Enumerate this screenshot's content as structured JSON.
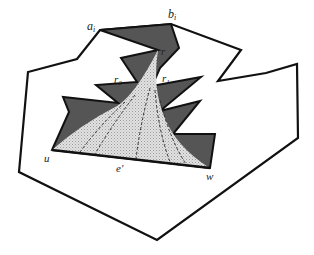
{
  "figure": {
    "colors": {
      "background": "#ffffff",
      "outline": "#111111",
      "dark_region": "#555555",
      "light_region": "#d8d8d8",
      "dashed_lines": "#333333"
    },
    "labels": {
      "a_i": "a",
      "a_i_sub": "i",
      "b_i": "b",
      "b_i_sub": "i",
      "r": "r",
      "r1": "r",
      "r1_sub": "1",
      "r2": "r",
      "r2_sub": "2",
      "u": "u",
      "w": "w",
      "e_prime": "e'"
    }
  }
}
